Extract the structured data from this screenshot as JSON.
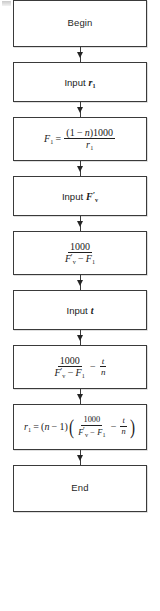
{
  "diagram": {
    "type": "flowchart",
    "orientation": "vertical",
    "title": "",
    "connector_icon": "down-arrow-icon",
    "colors": {
      "box_border": "#3a3a3a",
      "box_fill": "#ffffff",
      "text": "#1a1a1a",
      "arrow": "#242424",
      "page_background": "#ffffff"
    },
    "nodes": [
      {
        "id": "begin",
        "shape": "rectangle",
        "kind": "terminator",
        "text": "Begin"
      },
      {
        "id": "input-r1",
        "shape": "rectangle",
        "kind": "input",
        "keyword": "Input",
        "variable": "r",
        "subscript": "1",
        "text": "Input r₁"
      },
      {
        "id": "compute-F1",
        "shape": "rectangle",
        "kind": "process",
        "lhs_var": "F",
        "lhs_sub": "1",
        "equals": "=",
        "numerator_paren_open": "(1",
        "numerator_minus": "−",
        "numerator_n": "n",
        "numerator_paren_close": ")1000",
        "denominator_var": "r",
        "denominator_sub": "1",
        "text": "F₁ = (1 − n)1000 / r₁"
      },
      {
        "id": "input-Fv-prime",
        "shape": "rectangle",
        "kind": "input",
        "keyword": "Input",
        "variable": "F",
        "prime": "′",
        "subscript": "v",
        "text": "Input F′v"
      },
      {
        "id": "compute-ratio",
        "shape": "rectangle",
        "kind": "process",
        "numerator": "1000",
        "den_var1": "F",
        "den_prime": "′",
        "den_sub1": "v",
        "den_minus": "−",
        "den_var2": "F",
        "den_sub2": "1",
        "text": "1000 / (F′v − F₁)"
      },
      {
        "id": "input-t",
        "shape": "rectangle",
        "kind": "input",
        "keyword": "Input",
        "variable": "t",
        "text": "Input t"
      },
      {
        "id": "compute-ratio-minus-tn",
        "shape": "rectangle",
        "kind": "process",
        "numerator": "1000",
        "den_var1": "F",
        "den_prime": "′",
        "den_sub1": "v",
        "den_minus": "−",
        "den_var2": "F",
        "den_sub2": "1",
        "operator": "−",
        "second_num": "t",
        "second_den": "n",
        "text": "1000 / (F′v − F₁) − t/n"
      },
      {
        "id": "compute-r1",
        "shape": "rectangle",
        "kind": "process",
        "lhs_var": "r",
        "lhs_sub": "1",
        "equals": "=",
        "factor_open": "(",
        "factor_n": "n",
        "factor_minus": "−",
        "factor_one": "1)",
        "paren_open": "(",
        "numerator": "1000",
        "den_var1": "F",
        "den_prime": "′",
        "den_sub1": "v",
        "den_minus": "−",
        "den_var2": "F",
        "den_sub2": "1",
        "operator": "−",
        "second_num": "t",
        "second_den": "n",
        "paren_close": ")",
        "text": "r₁ = (n − 1)( 1000/(F′v − F₁) − t/n )"
      },
      {
        "id": "end",
        "shape": "rectangle",
        "kind": "terminator",
        "text": "End"
      }
    ]
  }
}
